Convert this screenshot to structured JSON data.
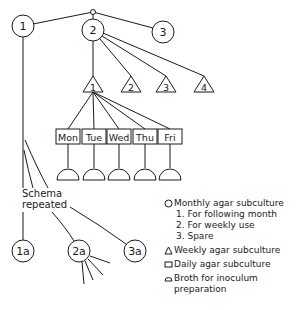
{
  "diagram": {
    "root_nodes": [
      {
        "label": "1",
        "shape": "circle"
      },
      {
        "label": "2",
        "shape": "circle"
      },
      {
        "label": "3",
        "shape": "circle"
      }
    ],
    "weekly_nodes": [
      {
        "label": "1",
        "shape": "triangle"
      },
      {
        "label": "2",
        "shape": "triangle"
      },
      {
        "label": "3",
        "shape": "triangle"
      },
      {
        "label": "4",
        "shape": "triangle"
      }
    ],
    "daily_nodes": [
      {
        "label": "Mon",
        "shape": "square"
      },
      {
        "label": "Tue",
        "shape": "square"
      },
      {
        "label": "Wed",
        "shape": "square"
      },
      {
        "label": "Thu",
        "shape": "square"
      },
      {
        "label": "Fri",
        "shape": "square"
      }
    ],
    "broth_count": 5,
    "schema_label": [
      "Schema",
      "repeated"
    ],
    "repeat_nodes": [
      {
        "label": "1a",
        "shape": "circle"
      },
      {
        "label": "2a",
        "shape": "circle"
      },
      {
        "label": "3a",
        "shape": "circle"
      }
    ]
  },
  "legend": {
    "monthly": {
      "icon": "circle-icon",
      "label": "Monthly agar subculture"
    },
    "monthly_sub": [
      "1. For following month",
      "2. For weekly use",
      "3. Spare"
    ],
    "weekly": {
      "icon": "triangle-icon",
      "label": "Weekly agar subculture"
    },
    "daily": {
      "icon": "square-icon",
      "label": "Daily agar subculture"
    },
    "broth": {
      "icon": "dome-icon",
      "label": "Broth for inoculum",
      "label2": "preparation"
    }
  }
}
